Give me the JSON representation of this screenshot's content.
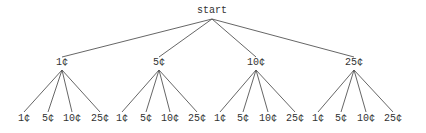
{
  "diagram": {
    "type": "tree",
    "line_color": "#555555",
    "text_color": "#333333",
    "root": {
      "label": "start",
      "x": 212,
      "y": 11,
      "anchor_bottom": 19
    },
    "level1": [
      {
        "label": "1¢",
        "x": 62,
        "y": 63
      },
      {
        "label": "5¢",
        "x": 159,
        "y": 63
      },
      {
        "label": "10¢",
        "x": 256,
        "y": 63
      },
      {
        "label": "25¢",
        "x": 354,
        "y": 63
      }
    ],
    "level2": [
      {
        "label": "1¢",
        "x": 24,
        "y": 119,
        "parent": 0
      },
      {
        "label": "5¢",
        "x": 48,
        "y": 119,
        "parent": 0
      },
      {
        "label": "10¢",
        "x": 72,
        "y": 119,
        "parent": 0
      },
      {
        "label": "25¢",
        "x": 100,
        "y": 119,
        "parent": 0
      },
      {
        "label": "1¢",
        "x": 122,
        "y": 119,
        "parent": 1
      },
      {
        "label": "5¢",
        "x": 146,
        "y": 119,
        "parent": 1
      },
      {
        "label": "10¢",
        "x": 170,
        "y": 119,
        "parent": 1
      },
      {
        "label": "25¢",
        "x": 197,
        "y": 119,
        "parent": 1
      },
      {
        "label": "1¢",
        "x": 220,
        "y": 119,
        "parent": 2
      },
      {
        "label": "5¢",
        "x": 243,
        "y": 119,
        "parent": 2
      },
      {
        "label": "10¢",
        "x": 268,
        "y": 119,
        "parent": 2
      },
      {
        "label": "25¢",
        "x": 295,
        "y": 119,
        "parent": 2
      },
      {
        "label": "1¢",
        "x": 318,
        "y": 119,
        "parent": 3
      },
      {
        "label": "5¢",
        "x": 341,
        "y": 119,
        "parent": 3
      },
      {
        "label": "10¢",
        "x": 366,
        "y": 119,
        "parent": 3
      },
      {
        "label": "25¢",
        "x": 393,
        "y": 119,
        "parent": 3
      }
    ]
  }
}
